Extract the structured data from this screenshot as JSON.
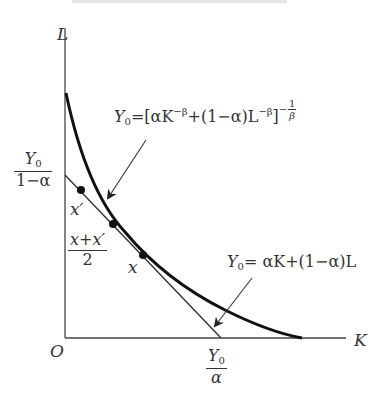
{
  "diagram": {
    "axes": {
      "y_label": "L",
      "x_label": "K",
      "origin_label": "O"
    },
    "y_intercept_label": {
      "numerator": "Y",
      "numerator_sub": "0",
      "denominator": "1−α"
    },
    "x_intercept_label": {
      "numerator": "Y",
      "numerator_sub": "0",
      "denominator": "α"
    },
    "points": {
      "x_prime": "x′",
      "midpoint": {
        "numerator": "x+x′",
        "denominator": "2"
      },
      "x": "x"
    },
    "ces_equation": {
      "lhs": "Y",
      "lhs_sub": "0",
      "body_a": "=[αK",
      "exp1": "−β",
      "body_b": "+(1−α)L",
      "exp2": "−β",
      "body_c": "]",
      "outer_exp_sign": "−",
      "outer_exp_num": "1",
      "outer_exp_den": "β"
    },
    "linear_equation": {
      "lhs": "Y",
      "lhs_sub": "0",
      "rhs": "= αK+(1−α)L"
    },
    "colors": {
      "line": "#333333",
      "curve": "#111111",
      "background": "#ffffff"
    }
  }
}
